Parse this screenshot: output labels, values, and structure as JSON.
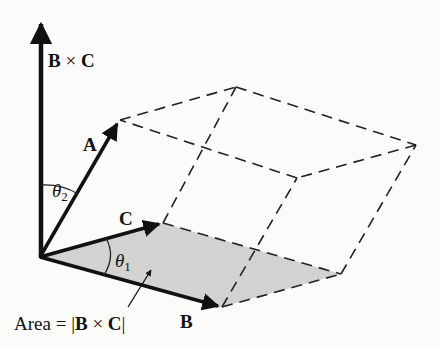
{
  "figure": {
    "colors": {
      "background": "#fbfbf9",
      "ink": "#111111",
      "shaded_face": "#d2d2d0"
    },
    "vectors": {
      "A": {
        "label": "A"
      },
      "B": {
        "label": "B"
      },
      "C": {
        "label": "C"
      },
      "BxC": {
        "label_left": "B",
        "operator": "×",
        "label_right": "C"
      }
    },
    "angles": {
      "theta1": {
        "symbol": "θ",
        "sub": "1"
      },
      "theta2": {
        "symbol": "θ",
        "sub": "2"
      }
    },
    "annotation": {
      "area_prefix": "Area = |",
      "area_B": "B",
      "area_op": " × ",
      "area_C": "C",
      "area_suffix": "|"
    }
  }
}
